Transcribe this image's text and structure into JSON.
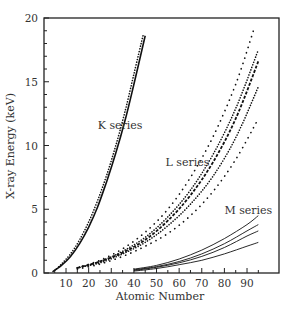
{
  "chart_data": {
    "type": "line",
    "title": "",
    "xlabel": "Atomic Number",
    "ylabel": "X-ray Energy (keV)",
    "xlim": [
      0,
      98
    ],
    "ylim": [
      0,
      20
    ],
    "x_ticks": [
      10,
      20,
      30,
      40,
      50,
      60,
      70,
      80,
      90
    ],
    "y_ticks": [
      0,
      5,
      10,
      15,
      20
    ],
    "grid": false,
    "legend": "none (inline labels)",
    "annotations": [
      {
        "text": "K series",
        "x": 24,
        "y": 11.3
      },
      {
        "text": "L series",
        "x": 54,
        "y": 8.4
      },
      {
        "text": "M series",
        "x": 80,
        "y": 4.6
      }
    ],
    "series": [
      {
        "name": "K series (solid)",
        "group": "K",
        "style": "solid",
        "x": [
          4,
          8,
          12,
          16,
          20,
          24,
          28,
          32,
          36,
          40,
          45
        ],
        "y": [
          0.1,
          0.6,
          1.3,
          2.3,
          3.6,
          5.2,
          7.2,
          9.4,
          11.9,
          14.8,
          18.6
        ]
      },
      {
        "name": "K series (dotted)",
        "group": "K",
        "style": "dotted",
        "x": [
          5,
          8,
          12,
          16,
          20,
          24,
          28,
          32,
          36,
          40,
          44
        ],
        "y": [
          0.2,
          0.7,
          1.5,
          2.6,
          4.0,
          5.7,
          7.7,
          10.0,
          12.6,
          15.6,
          18.6
        ]
      },
      {
        "name": "L series (sparse dotted, upper)",
        "group": "L",
        "style": "sparse-dotted",
        "x": [
          15,
          25,
          35,
          45,
          55,
          65,
          75,
          85,
          93
        ],
        "y": [
          0.4,
          1.0,
          1.9,
          3.2,
          5.0,
          7.5,
          10.7,
          14.8,
          19.1
        ]
      },
      {
        "name": "L series (dense dotted)",
        "group": "L",
        "style": "dotted",
        "x": [
          15,
          25,
          35,
          45,
          55,
          65,
          75,
          85,
          95
        ],
        "y": [
          0.4,
          0.9,
          1.7,
          2.8,
          4.4,
          6.5,
          9.3,
          12.9,
          17.5
        ]
      },
      {
        "name": "L series (dashed)",
        "group": "L",
        "style": "dashed",
        "x": [
          15,
          25,
          35,
          45,
          55,
          65,
          75,
          85,
          95
        ],
        "y": [
          0.4,
          0.9,
          1.6,
          2.6,
          4.1,
          6.1,
          8.7,
          12.1,
          16.6
        ]
      },
      {
        "name": "L series (dotted lower)",
        "group": "L",
        "style": "dotted",
        "x": [
          15,
          25,
          35,
          45,
          55,
          65,
          75,
          85,
          95
        ],
        "y": [
          0.4,
          0.8,
          1.5,
          2.4,
          3.7,
          5.4,
          7.6,
          10.6,
          14.6
        ]
      },
      {
        "name": "L series (sparse dotted, lower)",
        "group": "L",
        "style": "sparse-dotted",
        "x": [
          15,
          25,
          35,
          45,
          55,
          65,
          75,
          85,
          95
        ],
        "y": [
          0.3,
          0.7,
          1.3,
          2.1,
          3.1,
          4.5,
          6.4,
          8.9,
          12.1
        ]
      },
      {
        "name": "M series 1",
        "group": "M",
        "style": "solid",
        "x": [
          40,
          50,
          60,
          70,
          80,
          90,
          95
        ],
        "y": [
          0.3,
          0.6,
          1.1,
          1.8,
          2.7,
          3.8,
          4.5
        ]
      },
      {
        "name": "M series 2",
        "group": "M",
        "style": "solid",
        "x": [
          40,
          50,
          60,
          70,
          80,
          90,
          95
        ],
        "y": [
          0.25,
          0.5,
          0.9,
          1.5,
          2.3,
          3.3,
          3.8
        ]
      },
      {
        "name": "M series 3",
        "group": "M",
        "style": "solid",
        "x": [
          40,
          50,
          60,
          70,
          80,
          90,
          95
        ],
        "y": [
          0.2,
          0.45,
          0.8,
          1.3,
          2.0,
          2.9,
          3.3
        ]
      },
      {
        "name": "M series 4",
        "group": "M",
        "style": "solid",
        "x": [
          40,
          50,
          60,
          70,
          80,
          90,
          95
        ],
        "y": [
          0.15,
          0.35,
          0.65,
          1.0,
          1.5,
          2.1,
          2.4
        ]
      }
    ]
  },
  "plot_area": {
    "left": 44,
    "top": 18,
    "right": 279,
    "bottom": 273
  },
  "colors": {
    "line": "#111111",
    "axis": "#222222",
    "text": "#333333"
  }
}
